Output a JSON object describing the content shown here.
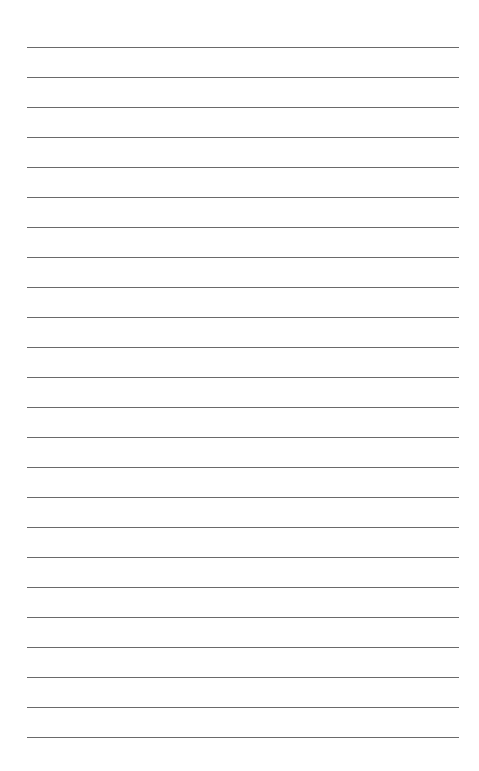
{
  "page": {
    "type": "lined-paper",
    "background": "#ffffff",
    "rule_color": "#6a6a6a",
    "rule_count": 24,
    "first_rule_y": 47,
    "rule_spacing": 30,
    "rule_left": 27,
    "rule_width": 432,
    "lines": [
      "",
      "",
      "",
      "",
      "",
      "",
      "",
      "",
      "",
      "",
      "",
      "",
      "",
      "",
      "",
      "",
      "",
      "",
      "",
      "",
      "",
      "",
      "",
      ""
    ]
  }
}
